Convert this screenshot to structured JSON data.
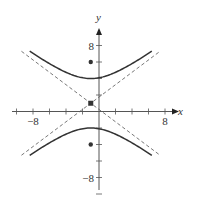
{
  "chart_data": {
    "type": "line",
    "title": "",
    "xlabel": "x",
    "ylabel": "y",
    "xlim": [
      -10,
      10
    ],
    "ylim": [
      -10,
      10
    ],
    "grid": false,
    "tick_step": 2,
    "tick_labels": {
      "x": [
        {
          "value": -8,
          "label": "−8"
        },
        {
          "value": 8,
          "label": "8"
        }
      ],
      "y": [
        {
          "value": 8,
          "label": "8"
        },
        {
          "value": -8,
          "label": "−8"
        }
      ]
    },
    "hyperbola": {
      "orientation": "vertical",
      "center": [
        -1,
        1
      ],
      "a": 3,
      "b": 4,
      "c": 5,
      "vertices": [
        [
          -1,
          4
        ],
        [
          -1,
          -2
        ]
      ],
      "foci": [
        [
          -1,
          6
        ],
        [
          -1,
          -4
        ]
      ],
      "x_range": [
        -8.4,
        6.4
      ]
    },
    "asymptotes": [
      {
        "slope": 0.75,
        "intercept_point": [
          -1,
          1
        ],
        "style": "dashed",
        "x_range": [
          -9.4,
          7.4
        ]
      },
      {
        "slope": -0.75,
        "intercept_point": [
          -1,
          1
        ],
        "style": "dashed",
        "x_range": [
          -9.4,
          7.4
        ]
      }
    ],
    "points": [
      {
        "name": "center",
        "x": -1,
        "y": 1,
        "marker": "square"
      },
      {
        "name": "focus-upper",
        "x": -1,
        "y": 6,
        "marker": "dot"
      },
      {
        "name": "focus-lower",
        "x": -1,
        "y": -4,
        "marker": "dot"
      }
    ],
    "colors": {
      "curve": "#333333",
      "axis": "#555555",
      "asymptote": "#555555",
      "point": "#333333"
    }
  }
}
